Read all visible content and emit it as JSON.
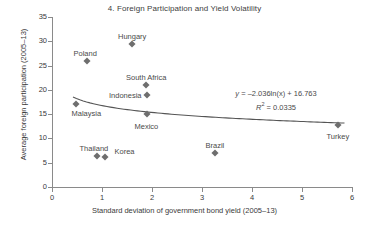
{
  "chart_data": {
    "type": "scatter",
    "title": "4. Foreign Participation and Yield Volatility",
    "xlabel": "Standard deviation of government bond yield (2005–13)",
    "ylabel": "Average foreign participation (2005–13)",
    "xlim": [
      0,
      6
    ],
    "ylim": [
      0,
      35
    ],
    "xticks": [
      "0",
      "1",
      "2",
      "3",
      "4",
      "5",
      "6"
    ],
    "yticks": [
      "0",
      "5",
      "10",
      "15",
      "20",
      "25",
      "30",
      "35"
    ],
    "grid": false,
    "legend": "none",
    "marker_color": "#6e6e6e",
    "trendline_color": "#555555",
    "points": [
      {
        "label": "Malaysia",
        "x": 0.47,
        "y": 17.1,
        "label_dx": -4,
        "label_dy": 9,
        "label_anchor": "start"
      },
      {
        "label": "Poland",
        "x": 0.7,
        "y": 26.0,
        "label_dx": -2,
        "label_dy": -8,
        "label_anchor": "middle"
      },
      {
        "label": "Thailand",
        "x": 0.9,
        "y": 6.4,
        "label_dx": -3,
        "label_dy": -8,
        "label_anchor": "middle"
      },
      {
        "label": "Korea",
        "x": 1.05,
        "y": 6.2,
        "label_dx": 10,
        "label_dy": -6,
        "label_anchor": "start"
      },
      {
        "label": "Hungary",
        "x": 1.6,
        "y": 29.4,
        "label_dx": 0,
        "label_dy": -8,
        "label_anchor": "middle"
      },
      {
        "label": "South Africa",
        "x": 1.88,
        "y": 21.0,
        "label_dx": 0,
        "label_dy": -8,
        "label_anchor": "middle"
      },
      {
        "label": "Indonesia",
        "x": 1.9,
        "y": 19.0,
        "label_dx": -5,
        "label_dy": 0,
        "label_anchor": "end"
      },
      {
        "label": "Mexico",
        "x": 1.89,
        "y": 15.0,
        "label_dx": 0,
        "label_dy": 12,
        "label_anchor": "middle"
      },
      {
        "label": "Brazil",
        "x": 3.26,
        "y": 6.9,
        "label_dx": 0,
        "label_dy": -8,
        "label_anchor": "middle"
      },
      {
        "label": "Turkey",
        "x": 5.72,
        "y": 12.7,
        "label_dx": 0,
        "label_dy": 11,
        "label_anchor": "middle"
      }
    ],
    "trendline": {
      "type": "logarithmic",
      "a": -2.036,
      "b": 16.763,
      "x_start": 0.42,
      "x_end": 5.85
    },
    "annotations": {
      "equation_y": "y",
      "equation_rest": " = –2.036ln(x) + 16.763",
      "equation_full": "y = –2.036ln(x) + 16.763",
      "r_squared_symbol": "R",
      "r_squared_sup": "2",
      "r_squared_value": " = 0.0335",
      "r_squared_full": "R² = 0.0335"
    }
  }
}
